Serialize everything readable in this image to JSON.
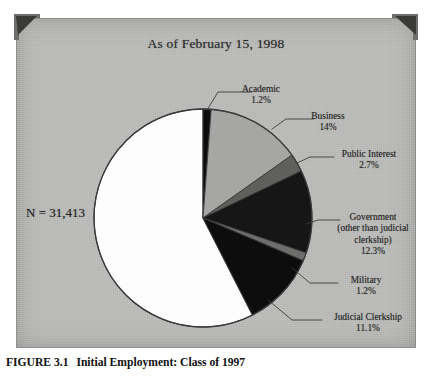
{
  "figure": {
    "caption_number": "FIGURE 3.1",
    "caption_text": "Initial Employment: Class of 1997"
  },
  "chart_title": "As of February 15, 1998",
  "n_label": "N = 31,413",
  "labels": {
    "academic": {
      "name": "Academic",
      "pct": "1.2%"
    },
    "business": {
      "name": "Business",
      "pct": "14%"
    },
    "public_interest": {
      "name": "Public Interest",
      "pct": "2.7%"
    },
    "government_l1": {
      "name": "Government"
    },
    "government_l2": {
      "name": "(other than judicial"
    },
    "government_l3": {
      "name": "clerkship)"
    },
    "government_pct": {
      "pct": "12.3%"
    },
    "military": {
      "name": "Military",
      "pct": "1.2%"
    },
    "judicial": {
      "name": "Judicial Clerkship",
      "pct": "11.1%"
    }
  },
  "colors": {
    "plate_background": "#bcbcba",
    "private_practice": "#fdfdfd",
    "academic": "#111111",
    "business": "#a6a6a4",
    "public_interest": "#5e5e5c",
    "government": "#161616",
    "military": "#6e6e6c",
    "judicial": "#101010",
    "outline": "#3a3a3a",
    "leader_line": "#3d3d3d",
    "corner_mark": "#3a3a38"
  },
  "chart_data": {
    "type": "pie",
    "title": "As of February 15, 1998",
    "subtitle": "",
    "total_label": "N = 31,413",
    "total": 31413,
    "units": "percent of graduates",
    "start_angle_deg": 0,
    "direction": "clockwise",
    "legend": "none (direct labels with leader lines)",
    "categories": [
      "Academic",
      "Business",
      "Public Interest",
      "Government (other than judicial clerkship)",
      "Military",
      "Judicial Clerkship",
      "Private Practice / other (unlabeled)"
    ],
    "values": [
      1.2,
      14,
      2.7,
      12.3,
      1.2,
      11.1,
      57.5
    ],
    "labeled": [
      true,
      true,
      true,
      true,
      true,
      true,
      false
    ],
    "slice_colors": [
      "#111111",
      "#a6a6a4",
      "#5e5e5c",
      "#161616",
      "#6e6e6c",
      "#101010",
      "#fdfdfd"
    ],
    "xlabel": "",
    "ylabel": ""
  }
}
